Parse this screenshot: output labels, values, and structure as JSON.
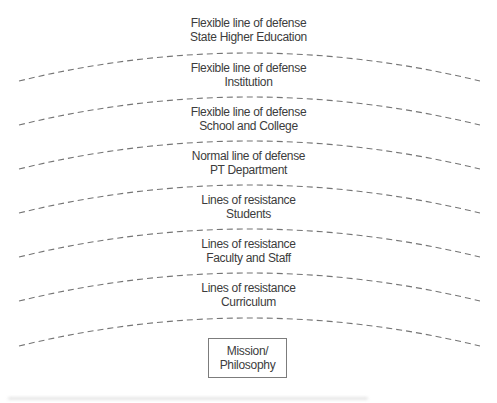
{
  "diagram": {
    "layers": [
      {
        "line1": "Flexible line of defense",
        "line2": "State Higher Education"
      },
      {
        "line1": "Flexible line of defense",
        "line2": "Institution"
      },
      {
        "line1": "Flexible line of defense",
        "line2": "School and College"
      },
      {
        "line1": "Normal line of defense",
        "line2": "PT Department"
      },
      {
        "line1": "Lines of resistance",
        "line2": "Students"
      },
      {
        "line1": "Lines of resistance",
        "line2": "Faculty and Staff"
      },
      {
        "line1": "Lines of resistance",
        "line2": "Curriculum"
      }
    ],
    "core": {
      "line1": "Mission/",
      "line2": "Philosophy"
    },
    "colors": {
      "background": "#ffffff",
      "text": "#3c3c3c",
      "dashed_line": "#757575",
      "core_box_border": "#7c7c7c"
    }
  }
}
